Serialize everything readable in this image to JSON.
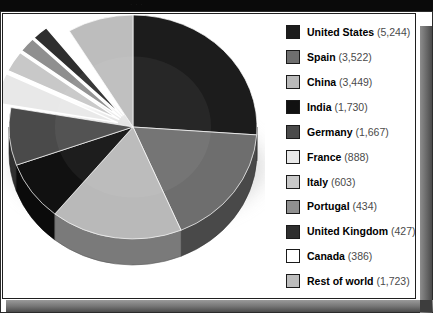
{
  "header": {
    "ghost_text": "· · ·"
  },
  "chart_data": {
    "type": "pie",
    "title": "",
    "subtitle": "",
    "xlabel": "",
    "ylabel": "",
    "total": 21273,
    "legend_position": "right",
    "grid": false,
    "categories": [
      "United States",
      "Spain",
      "China",
      "India",
      "Germany",
      "France",
      "Italy",
      "Portugal",
      "United Kingdom",
      "Canada",
      "Rest of world"
    ],
    "values": [
      5244,
      3522,
      3449,
      1730,
      1667,
      888,
      603,
      434,
      427,
      386,
      1723
    ],
    "value_labels": [
      "(5,244)",
      "(3,522)",
      "(3,449)",
      "(1,730)",
      "(1,667)",
      "(888)",
      "(603)",
      "(434)",
      "(427)",
      "(386)",
      "(1,723)"
    ],
    "colors": [
      "#1c1c1c",
      "#6e6e6e",
      "#b9b9b9",
      "#111111",
      "#4a4a4a",
      "#e8e8e8",
      "#c8c8c8",
      "#8f8f8f",
      "#2e2e2e",
      "#ffffff",
      "#bdbdbd"
    ],
    "slices": [
      {
        "label": "United States",
        "value": 5244,
        "value_label": "(5,244)",
        "color": "#1c1c1c",
        "exploded": false
      },
      {
        "label": "Spain",
        "value": 3522,
        "value_label": "(3,522)",
        "color": "#6e6e6e",
        "exploded": false
      },
      {
        "label": "China",
        "value": 3449,
        "value_label": "(3,449)",
        "color": "#b9b9b9",
        "exploded": false
      },
      {
        "label": "India",
        "value": 1730,
        "value_label": "(1,730)",
        "color": "#111111",
        "exploded": false
      },
      {
        "label": "Germany",
        "value": 1667,
        "value_label": "(1,667)",
        "color": "#4a4a4a",
        "exploded": false
      },
      {
        "label": "France",
        "value": 888,
        "value_label": "(888)",
        "color": "#e8e8e8",
        "exploded": true
      },
      {
        "label": "Italy",
        "value": 603,
        "value_label": "(603)",
        "color": "#c8c8c8",
        "exploded": true
      },
      {
        "label": "Portugal",
        "value": 434,
        "value_label": "(434)",
        "color": "#8f8f8f",
        "exploded": true
      },
      {
        "label": "United Kingdom",
        "value": 427,
        "value_label": "(427)",
        "color": "#2e2e2e",
        "exploded": true
      },
      {
        "label": "Canada",
        "value": 386,
        "value_label": "(386)",
        "color": "#ffffff",
        "exploded": true
      },
      {
        "label": "Rest of world",
        "value": 1723,
        "value_label": "(1,723)",
        "color": "#bdbdbd",
        "exploded": false
      }
    ]
  },
  "style": {
    "background": "#ffffff",
    "header_bar": "#0a0a0a",
    "frame_border": "#2b2b2b",
    "bevel_light": "#9a9a9a",
    "bevel_dark": "#4a4a4a",
    "legend_name_color": "#000000",
    "legend_value_color": "#4a4a4a"
  }
}
